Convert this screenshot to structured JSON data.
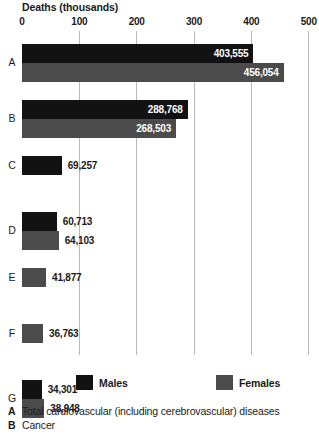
{
  "chart_data": {
    "type": "bar",
    "orientation": "horizontal",
    "title": "Deaths (thousands)",
    "xlabel": "Deaths (thousands)",
    "ylabel": "",
    "xlim": [
      0,
      500
    ],
    "xticks": [
      0,
      100,
      200,
      300,
      400,
      500
    ],
    "xtick_labels": [
      "0",
      "100",
      "200",
      "300",
      "400",
      "500"
    ],
    "grid": true,
    "legend_position": "bottom",
    "categories": [
      "A",
      "B",
      "C",
      "D",
      "E",
      "F",
      "G"
    ],
    "series": [
      {
        "name": "Males",
        "color": "#121212",
        "values": [
          403.555,
          288.768,
          69.257,
          60.713,
          null,
          null,
          34.301
        ],
        "labels": [
          "403,555",
          "288,768",
          "69,257",
          "60,713",
          null,
          null,
          "34,301"
        ]
      },
      {
        "name": "Females",
        "color": "#4b4b4b",
        "values": [
          456.054,
          268.503,
          null,
          64.103,
          41.877,
          36.763,
          38.948
        ],
        "labels": [
          "456,054",
          "268,503",
          null,
          "64,103",
          "41,877",
          "36,763",
          "38,948"
        ]
      }
    ],
    "groups": [
      {
        "letter": "A",
        "bars": [
          {
            "series": "Males",
            "value": 403.555,
            "label": "403,555",
            "label_inside": true
          },
          {
            "series": "Females",
            "value": 456.054,
            "label": "456,054",
            "label_inside": true
          }
        ]
      },
      {
        "letter": "B",
        "bars": [
          {
            "series": "Males",
            "value": 288.768,
            "label": "288,768",
            "label_inside": true
          },
          {
            "series": "Females",
            "value": 268.503,
            "label": "268,503",
            "label_inside": true
          }
        ]
      },
      {
        "letter": "C",
        "bars": [
          {
            "series": "Males",
            "value": 69.257,
            "label": "69,257",
            "label_inside": false
          }
        ]
      },
      {
        "letter": "D",
        "bars": [
          {
            "series": "Males",
            "value": 60.713,
            "label": "60,713",
            "label_inside": false
          },
          {
            "series": "Females",
            "value": 64.103,
            "label": "64,103",
            "label_inside": false
          }
        ]
      },
      {
        "letter": "E",
        "bars": [
          {
            "series": "Females",
            "value": 41.877,
            "label": "41,877",
            "label_inside": false
          }
        ]
      },
      {
        "letter": "F",
        "bars": [
          {
            "series": "Females",
            "value": 36.763,
            "label": "36,763",
            "label_inside": false
          }
        ]
      },
      {
        "letter": "G",
        "bars": [
          {
            "series": "Males",
            "value": 34.301,
            "label": "34,301",
            "label_inside": false
          },
          {
            "series": "Females",
            "value": 38.948,
            "label": "38,948",
            "label_inside": false
          }
        ]
      }
    ]
  },
  "legend": {
    "items": [
      {
        "label": "Males",
        "color": "#121212"
      },
      {
        "label": "Females",
        "color": "#4b4b4b"
      }
    ]
  },
  "key": {
    "rows": [
      {
        "letter": "A",
        "text": "Total cardiovascular (including cerebrovascular) diseases"
      },
      {
        "letter": "B",
        "text": "Cancer"
      }
    ]
  }
}
